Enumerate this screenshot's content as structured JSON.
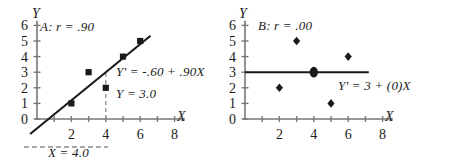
{
  "figure": {
    "background": "#ffffff",
    "ink": "#1a1a1a",
    "axis_color": "#777777",
    "panels": 2
  },
  "chart_data": [
    {
      "type": "scatter",
      "id": "A",
      "title": "A: r = .90",
      "xlabel": "X",
      "ylabel": "Y",
      "xlim": [
        0,
        8.6
      ],
      "ylim": [
        0,
        6.3
      ],
      "xticks": [
        0,
        1,
        2,
        3,
        4,
        5,
        6,
        7,
        8
      ],
      "xtick_labels": [
        "0",
        "",
        "2",
        "",
        "4",
        "",
        "6",
        "",
        "8"
      ],
      "yticks": [
        0,
        1,
        2,
        3,
        4,
        5,
        6
      ],
      "ytick_labels": [
        "0",
        "1",
        "2",
        "3",
        "4",
        "5",
        "6"
      ],
      "grid": false,
      "legend": "none",
      "x": [
        2,
        3,
        4,
        5,
        6
      ],
      "y": [
        1,
        3,
        2,
        4,
        5
      ],
      "marker": "square",
      "fit_line": {
        "equation": "Y' = -.60 + .90X",
        "intercept": -0.6,
        "slope": 0.9,
        "x_from": -0.4,
        "x_to": 6.6
      },
      "annotations": [
        {
          "text": "Y' = -.60 + .90X",
          "kind": "equation"
        },
        {
          "text": "Y = 3.0",
          "kind": "predicted-value"
        },
        {
          "text": "X = 4.0",
          "kind": "given-value"
        }
      ],
      "guides": {
        "vertical_at_x": 4,
        "vertical_from_y": 0,
        "vertical_to_y": 3.0,
        "horizontal_label": "X = 4.0",
        "style": "dashed"
      }
    },
    {
      "type": "scatter",
      "id": "B",
      "title": "B: r = .00",
      "xlabel": "X",
      "ylabel": "Y",
      "xlim": [
        0,
        8.6
      ],
      "ylim": [
        0,
        6.3
      ],
      "xticks": [
        0,
        1,
        2,
        3,
        4,
        5,
        6,
        7,
        8
      ],
      "xtick_labels": [
        "0",
        "",
        "2",
        "",
        "4",
        "",
        "6",
        "",
        "8"
      ],
      "yticks": [
        0,
        1,
        2,
        3,
        4,
        5,
        6
      ],
      "ytick_labels": [
        "0",
        "1",
        "2",
        "3",
        "4",
        "5",
        "6"
      ],
      "grid": false,
      "legend": "none",
      "x": [
        2,
        3,
        4,
        5,
        6
      ],
      "y": [
        2,
        5,
        3,
        1,
        4
      ],
      "marker": "diamond",
      "fit_line": {
        "equation": "Y' = 3 + (0)X",
        "intercept": 3,
        "slope": 0,
        "x_from": 0,
        "x_to": 7.2
      },
      "highlight_point": {
        "x": 4,
        "y": 3
      },
      "annotations": [
        {
          "text": "Y' = 3 + (0)X",
          "kind": "equation"
        }
      ]
    }
  ],
  "panel_a": {
    "title": "A: r = .90",
    "axis_y": "Y",
    "axis_x": "X",
    "equation": "Y' = -.60 + .90X",
    "predicted": "Y = 3.0",
    "given": "X = 4.0",
    "yticks": [
      "6",
      "5",
      "4",
      "3",
      "2",
      "1",
      "0"
    ],
    "xticks": [
      "2",
      "4",
      "6",
      "8"
    ]
  },
  "panel_b": {
    "title": "B: r = .00",
    "axis_y": "Y",
    "axis_x": "X",
    "equation": "Y' = 3 + (0)X",
    "yticks": [
      "6",
      "5",
      "4",
      "3",
      "2",
      "1",
      "0"
    ],
    "xticks": [
      "2",
      "4",
      "6",
      "8"
    ]
  }
}
